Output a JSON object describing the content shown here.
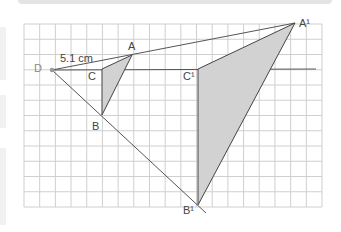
{
  "figure": {
    "measurement_label": "5.1 cm",
    "points": {
      "D": {
        "label": "D",
        "x": 52,
        "y": 70
      },
      "A": {
        "label": "A",
        "x": 132,
        "y": 55
      },
      "B": {
        "label": "B",
        "x": 102,
        "y": 115
      },
      "C": {
        "label": "C",
        "x": 102,
        "y": 69
      },
      "A_prime": {
        "label": "A¹",
        "x": 295,
        "y": 23
      },
      "B_prime": {
        "label": "B¹",
        "x": 198,
        "y": 205
      },
      "C_prime": {
        "label": "C¹",
        "x": 198,
        "y": 69
      }
    },
    "grid": {
      "columns": 19,
      "rows": 12,
      "left": 24,
      "top": 24,
      "right": 322,
      "bottom": 207
    },
    "colors": {
      "grid_line": "#cfcfcf",
      "construction_line": "#555555",
      "triangle_fill": "#d2d2d2",
      "triangle_stroke": "#444444",
      "centre_point": "#9a9a9a"
    }
  }
}
